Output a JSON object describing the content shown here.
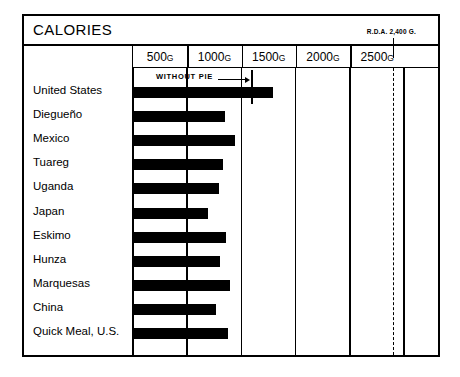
{
  "chart": {
    "title": "CALORIES",
    "rda_note": "R.D.A. 2,400 G.",
    "annotation": "WITHOUT PIE"
  },
  "chart_data": {
    "type": "bar",
    "orientation": "horizontal",
    "title": "CALORIES",
    "xlabel": "",
    "ylabel": "",
    "xlim": [
      0,
      2800
    ],
    "grid": true,
    "legend": "none",
    "tick_labels": [
      "500G",
      "1000G",
      "1500G",
      "2000G",
      "2500G"
    ],
    "tick_values": [
      500,
      1000,
      1500,
      2000,
      2500
    ],
    "unit": "G",
    "reference_line": {
      "label": "R.D.A. 2,400 G.",
      "value": 2400,
      "style": "dashed"
    },
    "annotations": [
      {
        "text": "WITHOUT PIE",
        "category": "United States",
        "value": 1100,
        "style": "arrow-to-tick"
      }
    ],
    "categories": [
      "United States",
      "Diegueño",
      "Mexico",
      "Tuareg",
      "Uganda",
      "Japan",
      "Eskimo",
      "Hunza",
      "Marquesas",
      "China",
      "Quick Meal, U.S."
    ],
    "values": [
      1300,
      860,
      945,
      835,
      800,
      700,
      865,
      810,
      900,
      770,
      880
    ]
  }
}
